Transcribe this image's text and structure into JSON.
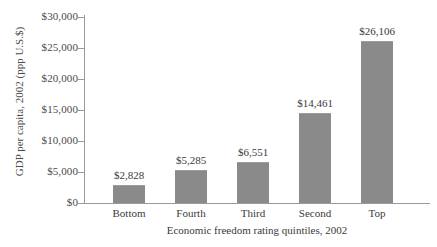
{
  "chart_data": {
    "type": "bar",
    "title": "",
    "subtitle": "",
    "xlabel": "Economic freedom rating quintiles, 2002",
    "ylabel": "GDP per capita, 2002 (ppp U.S.$)",
    "categories": [
      "Bottom",
      "Fourth",
      "Third",
      "Second",
      "Top"
    ],
    "values": [
      2828,
      5285,
      6551,
      14461,
      26106
    ],
    "value_labels": [
      "$2,828",
      "$5,285",
      "$6,551",
      "$14,461",
      "$26,106"
    ],
    "ylim": [
      0,
      30000
    ],
    "ytick_values": [
      30000,
      25000,
      20000,
      15000,
      10000,
      5000,
      0
    ],
    "ytick_labels": [
      "$30,000",
      "$25,000",
      "$20,000",
      "$15,000",
      "$10,000",
      "$5,000",
      "$0"
    ],
    "grid": false,
    "legend": "none",
    "bar_color": "#8a8a8a",
    "axis_color": "#9a9a9a",
    "background_color": "#ffffff"
  }
}
